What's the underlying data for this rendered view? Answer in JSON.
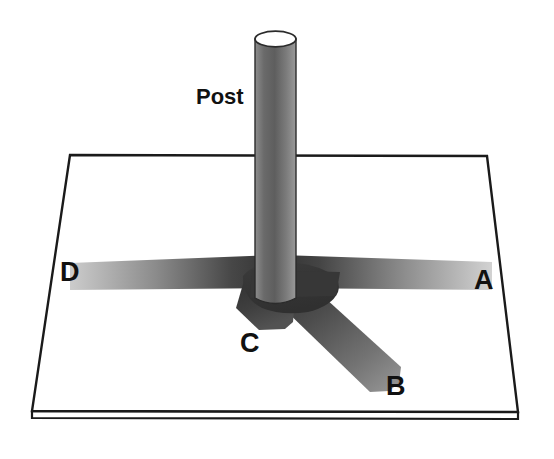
{
  "figure": {
    "title_label": "Post",
    "background_color": "#ffffff",
    "outline_color": "#1a1a1a",
    "labels": [
      {
        "id": "post",
        "text": "Post",
        "x": 196,
        "y": 104
      },
      {
        "id": "a",
        "text": "A",
        "x": 474,
        "y": 289
      },
      {
        "id": "b",
        "text": "B",
        "x": 386,
        "y": 395
      },
      {
        "id": "c",
        "text": "C",
        "x": 240,
        "y": 352
      },
      {
        "id": "d",
        "text": "D",
        "x": 60,
        "y": 281
      }
    ],
    "platform": {
      "name": "ground-plane",
      "top_face_points": "70,155 487,156 518,412 32,411",
      "front_edge_points": "32,411 518,412 518,419 32,418",
      "fill": "#ffffff",
      "stroke": "#1a1a1a",
      "stroke_width": 2.2
    },
    "post": {
      "name": "vertical-post",
      "x_left": 255,
      "x_right": 296,
      "y_top": 32,
      "y_bottom": 300,
      "cap_rx": 20.5,
      "cap_ry": 7.5,
      "cap_fill": "#ffffff",
      "body_gradient": [
        "#8d8d8d",
        "#5e5e5e",
        "#7b7b7b",
        "#9a9a9a"
      ],
      "stroke": "#2b2b2b"
    },
    "hub": {
      "name": "center-hub",
      "fill": "#3f3f3f"
    },
    "arms": [
      {
        "id": "a",
        "name": "arm-a",
        "direction": "right-horizontal",
        "points": "283,255 492,262 492,289 283,287",
        "gradient_from": "#3a3a3a",
        "gradient_to": "#cdcdcd"
      },
      {
        "id": "b",
        "name": "arm-b",
        "direction": "lower-right-diagonal",
        "points": "282,281 312,289 400,370 394,389 372,394 288,304",
        "gradient_from": "#3a3a3a",
        "gradient_to": "#8e8e8e"
      },
      {
        "id": "c",
        "name": "arm-c",
        "direction": "lower-left-short",
        "points": "248,277 292,287 289,324 258,328 238,306",
        "gradient_from": "#333333",
        "gradient_to": "#4e4e4e"
      },
      {
        "id": "d",
        "name": "arm-d",
        "direction": "left-horizontal",
        "points": "70,263 270,256 270,288 70,290",
        "gradient_from": "#3a3a3a",
        "gradient_to": "#c6c6c6"
      }
    ]
  }
}
